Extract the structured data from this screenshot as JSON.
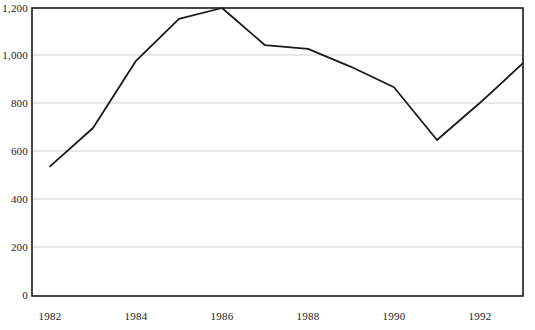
{
  "chart_data": {
    "type": "line",
    "title": "",
    "subtitle": "",
    "xlabel": "",
    "ylabel": "",
    "x": [
      1982,
      1983,
      1984,
      1985,
      1986,
      1987,
      1988,
      1989,
      1990,
      1991,
      1992,
      1993
    ],
    "values": [
      540,
      700,
      980,
      1155,
      1200,
      1045,
      1030,
      955,
      870,
      650,
      805,
      970
    ],
    "series": [
      {
        "name": "",
        "values": [
          540,
          700,
          980,
          1155,
          1200,
          1045,
          1030,
          955,
          870,
          650,
          805,
          970
        ]
      }
    ],
    "xlim": [
      1982,
      1993
    ],
    "ylim": [
      0,
      1200
    ],
    "y_ticks": [
      0,
      200,
      400,
      600,
      800,
      1000,
      1200
    ],
    "y_tick_labels": [
      "0",
      "200",
      "400",
      "600",
      "800",
      "1,000",
      "1,200"
    ],
    "x_ticks": [
      1982,
      1984,
      1986,
      1988,
      1990,
      1992
    ],
    "x_tick_labels": [
      "1982",
      "1984",
      "1986",
      "1988",
      "1990",
      "1992"
    ],
    "grid": "horizontal",
    "legend": "none",
    "line_color": "#1a1a1a",
    "grid_color": "#cfcfcf",
    "axis_color": "#1a1a1a",
    "background_color": "#ffffff",
    "annotations": []
  }
}
